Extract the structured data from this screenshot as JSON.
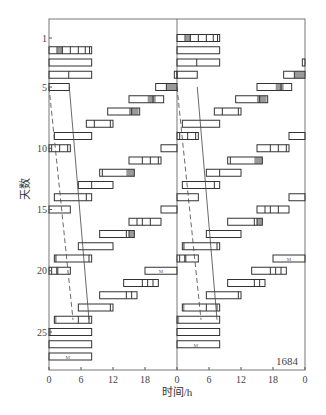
{
  "chart_data": {
    "type": "actogram",
    "title": "",
    "annotation": "1684",
    "xlabel": "时间/h",
    "ylabel": "天数",
    "double_plotted": true,
    "x_ticks": [
      "0",
      "6",
      "12",
      "18",
      "0",
      "6",
      "12",
      "18",
      "0"
    ],
    "x_range_hours": [
      0,
      48
    ],
    "y_ticks": [
      {
        "label": "1",
        "day": 1
      },
      {
        "label": "5",
        "day": 5
      },
      {
        "label": "10",
        "day": 10
      },
      {
        "label": "15",
        "day": 15
      },
      {
        "label": "20",
        "day": 20
      },
      {
        "label": "25",
        "day": 25
      }
    ],
    "y_range_days": [
      1,
      28
    ],
    "days": [
      {
        "day": 2,
        "bars": [
          [
            0,
            8
          ]
        ],
        "marks": [
          1.5,
          2.5,
          4,
          5.5,
          6.8,
          7.6
        ],
        "shaded": [
          [
            1.6,
            2.6
          ]
        ]
      },
      {
        "day": 3,
        "bars": [
          [
            0,
            8
          ]
        ],
        "marks": [],
        "shaded": []
      },
      {
        "day": 4,
        "bars": [
          [
            0,
            8
          ],
          [
            23.5,
            24
          ]
        ],
        "marks": [
          3.7
        ],
        "shaded": []
      },
      {
        "day": 5,
        "bars": [
          [
            0,
            3.8
          ],
          [
            20,
            24
          ]
        ],
        "marks": [
          22
        ],
        "shaded": [
          [
            22,
            24
          ]
        ]
      },
      {
        "day": 6,
        "bars": [
          [
            15,
            21.5
          ]
        ],
        "marks": [
          19.5
        ],
        "shaded": [
          [
            18.5,
            20
          ]
        ]
      },
      {
        "day": 7,
        "bars": [
          [
            11,
            17
          ]
        ],
        "marks": [
          15.5
        ],
        "shaded": [
          [
            15,
            16.8
          ]
        ]
      },
      {
        "day": 8,
        "bars": [
          [
            7,
            12
          ]
        ],
        "marks": [
          8.5,
          11.5
        ],
        "shaded": []
      },
      {
        "day": 9,
        "bars": [
          [
            1,
            8
          ]
        ],
        "marks": [],
        "shaded": []
      },
      {
        "day": 10,
        "bars": [
          [
            0,
            4
          ],
          [
            21,
            24
          ]
        ],
        "marks": [
          0.5,
          2,
          3.5
        ],
        "shaded": []
      },
      {
        "day": 11,
        "bars": [
          [
            15,
            21
          ]
        ],
        "marks": [
          17.5,
          19,
          20.5
        ],
        "shaded": []
      },
      {
        "day": 12,
        "bars": [
          [
            9.5,
            16
          ]
        ],
        "marks": [
          10
        ],
        "shaded": [
          [
            14.5,
            16
          ]
        ]
      },
      {
        "day": 13,
        "bars": [
          [
            5.5,
            12
          ]
        ],
        "marks": [
          8
        ],
        "shaded": []
      },
      {
        "day": 14,
        "bars": [
          [
            1,
            8
          ]
        ],
        "marks": [
          7
        ],
        "shaded": []
      },
      {
        "day": 15,
        "bars": [
          [
            0,
            4
          ],
          [
            21,
            24
          ]
        ],
        "marks": [],
        "shaded": [
          [
            24,
            24
          ]
        ]
      },
      {
        "day": 16,
        "bars": [
          [
            15,
            21
          ]
        ],
        "marks": [
          16.5,
          17.5,
          19
        ],
        "shaded": []
      },
      {
        "day": 17,
        "bars": [
          [
            9.5,
            16
          ]
        ],
        "marks": [
          14.5,
          15
        ],
        "shaded": [
          [
            15,
            16
          ]
        ]
      },
      {
        "day": 18,
        "bars": [
          [
            5.5,
            12
          ]
        ],
        "marks": [],
        "shaded": []
      },
      {
        "day": 19,
        "bars": [
          [
            1,
            8
          ]
        ],
        "marks": [
          1.3,
          7.5
        ],
        "shaded": []
      },
      {
        "day": 20,
        "bars": [
          [
            0,
            4
          ],
          [
            18,
            24
          ]
        ],
        "marks": [
          0.5,
          1.5
        ],
        "shaded": [
          [
            1.3,
            1.8
          ]
        ],
        "labels": [
          {
            "x": 21,
            "text": "M"
          }
        ]
      },
      {
        "day": 21,
        "bars": [
          [
            14,
            20.5
          ]
        ],
        "marks": [
          17.5,
          18.5,
          19.5
        ],
        "shaded": []
      },
      {
        "day": 22,
        "bars": [
          [
            9.5,
            16.5
          ]
        ],
        "marks": [
          14.5,
          15.5
        ],
        "shaded": []
      },
      {
        "day": 23,
        "bars": [
          [
            5.5,
            12
          ]
        ],
        "marks": [
          11.5
        ],
        "shaded": []
      },
      {
        "day": 24,
        "bars": [
          [
            1,
            8
          ]
        ],
        "marks": [
          5.5,
          7.5
        ],
        "shaded": [
          [
            1,
            1.3
          ]
        ]
      },
      {
        "day": 25,
        "bars": [
          [
            0,
            8
          ]
        ],
        "marks": [],
        "shaded": [
          [
            0,
            0.3
          ]
        ]
      },
      {
        "day": 26,
        "bars": [
          [
            0,
            8
          ]
        ],
        "marks": [],
        "shaded": []
      },
      {
        "day": 27,
        "bars": [
          [
            0,
            8
          ]
        ],
        "marks": [],
        "shaded": [],
        "labels": [
          {
            "x": 3.5,
            "text": "M"
          }
        ]
      }
    ],
    "trend_lines": [
      {
        "style": "dashed",
        "points": [
          [
            0,
            5
          ],
          [
            4.5,
            24
          ]
        ]
      },
      {
        "style": "solid",
        "points": [
          [
            3.8,
            5
          ],
          [
            7.5,
            24
          ]
        ]
      }
    ]
  }
}
